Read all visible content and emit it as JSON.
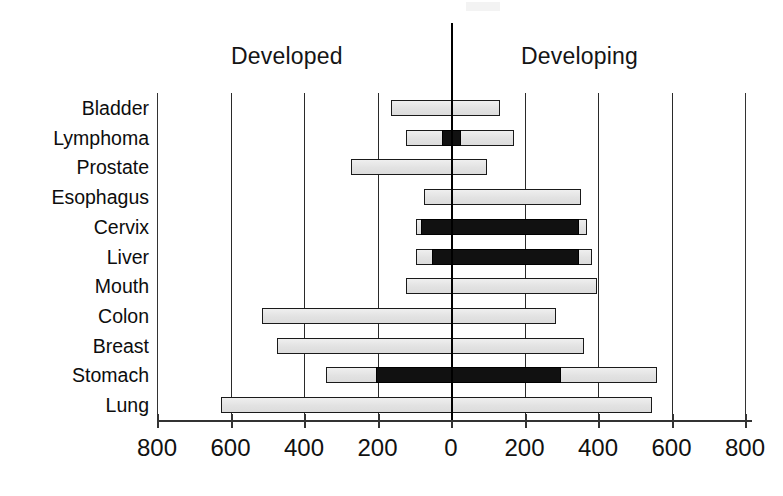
{
  "figure": {
    "background": "#ffffff",
    "ink_color": "#000000",
    "bar_fill_light": "#e6e6e6",
    "bar_fill_dark": "#111111",
    "bar_border": "#1a1a1a"
  },
  "headers": {
    "left": "Developed",
    "right": "Developing"
  },
  "axis": {
    "tick_labels": [
      "800",
      "600",
      "400",
      "200",
      "0",
      "200",
      "400",
      "600",
      "800"
    ],
    "tick_values": [
      -800,
      -600,
      -400,
      -200,
      0,
      200,
      400,
      600,
      800
    ]
  },
  "chart_data": {
    "type": "bar",
    "orientation": "horizontal",
    "title": "",
    "subtitle": "",
    "xlabel": "",
    "ylabel": "",
    "xlim": [
      -800,
      800
    ],
    "grid": true,
    "legend_position": "top",
    "annotations": [
      "Developed",
      "Developing"
    ],
    "note": "Diverging (back-to-back) horizontal bar chart. Left side = Developed (values plotted leftward from 0), right side = Developing. Dark inner segments mark a sub-portion of each bar.",
    "categories": [
      "Bladder",
      "Lymphoma",
      "Prostate",
      "Esophagus",
      "Cervix",
      "Liver",
      "Mouth",
      "Colon",
      "Breast",
      "Stomach",
      "Lung"
    ],
    "series": [
      {
        "name": "Developed",
        "side": "left",
        "values": [
          163,
          122,
          272,
          73,
          95,
          95,
          122,
          514,
          473,
          340,
          625
        ]
      },
      {
        "name": "Developing",
        "side": "right",
        "values": [
          133,
          171,
          98,
          353,
          370,
          383,
          397,
          285,
          361,
          560,
          546
        ]
      },
      {
        "name": "Dark sub-segment (from)",
        "side": "both",
        "values": [
          null,
          -24,
          null,
          null,
          -82,
          -52,
          null,
          null,
          null,
          -204,
          null
        ]
      },
      {
        "name": "Dark sub-segment (to)",
        "side": "both",
        "values": [
          null,
          27,
          null,
          null,
          348,
          348,
          null,
          null,
          null,
          299,
          null
        ]
      }
    ],
    "rows": [
      {
        "label": "Bladder",
        "developed": 163,
        "developing": 133,
        "dark_from": null,
        "dark_to": null
      },
      {
        "label": "Lymphoma",
        "developed": 122,
        "developing": 171,
        "dark_from": -24,
        "dark_to": 27
      },
      {
        "label": "Prostate",
        "developed": 272,
        "developing": 98,
        "dark_from": null,
        "dark_to": null
      },
      {
        "label": "Esophagus",
        "developed": 73,
        "developing": 353,
        "dark_from": null,
        "dark_to": null
      },
      {
        "label": "Cervix",
        "developed": 95,
        "developing": 370,
        "dark_from": -82,
        "dark_to": 348
      },
      {
        "label": "Liver",
        "developed": 95,
        "developing": 383,
        "dark_from": -52,
        "dark_to": 348
      },
      {
        "label": "Mouth",
        "developed": 122,
        "developing": 397,
        "dark_from": null,
        "dark_to": null
      },
      {
        "label": "Colon",
        "developed": 514,
        "developing": 285,
        "dark_from": null,
        "dark_to": null
      },
      {
        "label": "Breast",
        "developed": 473,
        "developing": 361,
        "dark_from": null,
        "dark_to": null
      },
      {
        "label": "Stomach",
        "developed": 340,
        "developing": 560,
        "dark_from": -204,
        "dark_to": 299
      },
      {
        "label": "Lung",
        "developed": 625,
        "developing": 546,
        "dark_from": null,
        "dark_to": null
      }
    ]
  }
}
